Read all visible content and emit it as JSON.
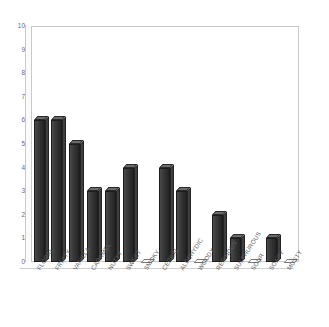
{
  "chart_data": {
    "type": "bar",
    "title": "",
    "subtitle": "",
    "xlabel": "",
    "ylabel": "",
    "ylim": [
      0,
      10
    ],
    "yticks": [
      0,
      1,
      2,
      3,
      4,
      5,
      6,
      7,
      8,
      9,
      10
    ],
    "ytick_labels": [
      "0",
      "1",
      "2",
      "3",
      "4",
      "5",
      "6",
      "7",
      "8",
      "9",
      "10"
    ],
    "grid": false,
    "legend": false,
    "legend_position": "none",
    "bar_style": "3d-column",
    "bar_color": "#333333",
    "categories": [
      "FLORAL",
      "FRUITY",
      "VANILLA",
      "CARAMEL",
      "NUTTY",
      "SWEET",
      "SMOKY",
      "CEREAL",
      "ALDEHYDIC",
      "WOODY",
      "RESINOUS",
      "SULPHUROUS",
      "SOUR",
      "SOAPY",
      "MUSTY"
    ],
    "values": [
      6,
      6,
      5,
      3,
      3,
      4,
      0,
      4,
      3,
      0,
      2,
      1,
      0,
      1,
      0
    ]
  },
  "colors": {
    "bar": "#333333",
    "bar_top": "#6b6b6b",
    "axis": "#c9c9c9",
    "tick_text": "#5f5f5f",
    "background": "#ffffff"
  }
}
